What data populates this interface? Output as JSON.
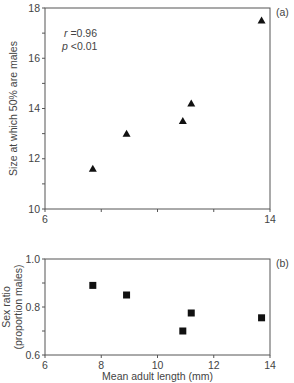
{
  "chart_data": [
    {
      "panel_label": "(a)",
      "type": "scatter",
      "marker": "triangle",
      "title": "",
      "xlabel": "",
      "ylabel": "Size at which 50% are males",
      "xlim": [
        6,
        14
      ],
      "ylim": [
        10,
        18
      ],
      "x_ticks": [
        6,
        8,
        10,
        12,
        14
      ],
      "x_tick_labels": [
        "6",
        "",
        "",
        "",
        "14"
      ],
      "y_ticks": [
        10,
        11,
        12,
        13,
        14,
        15,
        16,
        17,
        18
      ],
      "y_tick_labels": {
        "10": "10",
        "12": "12",
        "14": "14",
        "16": "16",
        "18": "18"
      },
      "annotation": {
        "r": "r =0.96",
        "p": "p <0.01"
      },
      "grid": false,
      "x": [
        7.7,
        8.9,
        10.9,
        11.2,
        13.7
      ],
      "y": [
        11.6,
        13.0,
        13.5,
        14.2,
        17.5
      ]
    },
    {
      "panel_label": "(b)",
      "type": "scatter",
      "marker": "square",
      "title": "",
      "xlabel": "Mean adult length (mm)",
      "ylabel": "Sex ratio\n(proportion males)",
      "ylabel_lines": [
        "Sex ratio",
        "(proportion males)"
      ],
      "xlim": [
        6,
        14
      ],
      "ylim": [
        0.6,
        1.0
      ],
      "x_ticks": [
        6,
        8,
        10,
        12,
        14
      ],
      "x_tick_labels": [
        "6",
        "8",
        "10",
        "12",
        "14"
      ],
      "y_ticks": [
        0.6,
        0.7,
        0.8,
        0.9,
        1.0
      ],
      "y_tick_labels": {
        "0.6": "0.6",
        "0.8": "0.8",
        "1.0": "1.0"
      },
      "grid": false,
      "x": [
        7.7,
        8.9,
        10.9,
        11.2,
        13.7
      ],
      "y": [
        0.89,
        0.85,
        0.7,
        0.775,
        0.755
      ]
    }
  ],
  "colors": {
    "axis": "#555555",
    "marker": "#111111",
    "text": "#444444"
  }
}
